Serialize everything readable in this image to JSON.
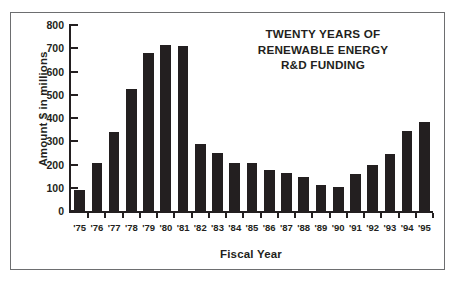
{
  "chart_data": {
    "type": "bar",
    "title": "TWENTY YEARS OF RENEWABLE ENERGY R&D FUNDING",
    "title_lines": [
      "TWENTY YEARS OF",
      "RENEWABLE ENERGY",
      "R&D FUNDING"
    ],
    "xlabel": "Fiscal Year",
    "ylabel": "Amount $ in millions",
    "categories": [
      "'75",
      "'76",
      "'77",
      "'78",
      "'79",
      "'80",
      "'81",
      "'82",
      "'83",
      "'84",
      "'85",
      "'86",
      "'87",
      "'88",
      "'89",
      "'90",
      "'91",
      "'92",
      "'93",
      "'94",
      "'95"
    ],
    "values": [
      90,
      205,
      340,
      525,
      680,
      715,
      710,
      290,
      250,
      205,
      205,
      175,
      165,
      145,
      110,
      105,
      160,
      200,
      245,
      345,
      385
    ],
    "ylim": [
      0,
      800
    ],
    "yticks": [
      0,
      100,
      200,
      300,
      400,
      500,
      600,
      700,
      800
    ],
    "ytick_labels": [
      "0",
      "100",
      "200",
      "300",
      "400",
      "500",
      "600",
      "700",
      "800"
    ],
    "grid": false,
    "legend": null,
    "bar_color": "#231f20",
    "axis_color": "#231f20",
    "frame_color": "#6d6e70",
    "background": "#ffffff"
  }
}
